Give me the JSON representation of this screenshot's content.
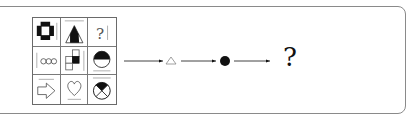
{
  "puzzle": {
    "grid": {
      "rows": 3,
      "cols": 3,
      "cells": [
        {
          "name": "thick-plus-ring",
          "marks": [
            "right-bar"
          ]
        },
        {
          "name": "half-filled-triangle",
          "marks": [
            "top-bar"
          ]
        },
        {
          "name": "question-mark",
          "symbol": "?",
          "marks": [
            "right-bar"
          ]
        },
        {
          "name": "three-rings",
          "marks": [
            "left-bar"
          ]
        },
        {
          "name": "stepped-squares-one-filled",
          "marks": [
            "right-bar"
          ]
        },
        {
          "name": "half-filled-circle",
          "marks": [
            "bottom-bar"
          ]
        },
        {
          "name": "outline-arrow-right",
          "marks": [
            "top-bar"
          ]
        },
        {
          "name": "heart-outline",
          "marks": [
            "bottom-bar"
          ]
        },
        {
          "name": "circle-x-top-quadrant-filled",
          "marks": [
            "top-bar"
          ]
        }
      ]
    },
    "sequence": {
      "steps": [
        {
          "type": "arrow"
        },
        {
          "type": "symbol",
          "name": "small-triangle-outline",
          "glyph": "△"
        },
        {
          "type": "arrow"
        },
        {
          "type": "symbol",
          "name": "filled-dot",
          "glyph": "●"
        },
        {
          "type": "arrow"
        },
        {
          "type": "symbol",
          "name": "question-mark",
          "glyph": "?"
        }
      ],
      "answer_placeholder": "?"
    }
  },
  "colors": {
    "frame": "#8a8a8a",
    "ink": "#111111",
    "grid": "#6a6a6a"
  }
}
